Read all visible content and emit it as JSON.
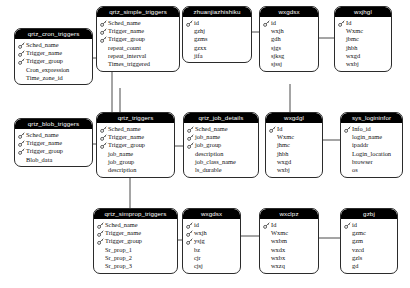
{
  "diagram": {
    "type": "entity-relationship",
    "key_icon": "key-icon",
    "colors": {
      "header_bg": "#000000",
      "header_text": "#ffffff",
      "body_bg": "#ffffff",
      "border": "#2b2b2b",
      "field_text": "#111111",
      "connector": "#4a4a4a"
    }
  },
  "entities": [
    {
      "id": "qrtz_cron_triggers",
      "name": "qrtz_cron_triggers",
      "x": 14,
      "y": 28,
      "w": 79,
      "fields": [
        {
          "name": "Sched_name",
          "key": true
        },
        {
          "name": "Trigger_name",
          "key": true
        },
        {
          "name": "Trigger_group",
          "key": true
        },
        {
          "name": "Cron_expression",
          "key": false
        },
        {
          "name": "Time_zone_id",
          "key": false
        }
      ]
    },
    {
      "id": "qrtz_simple_triggers",
      "name": "qrtz_simple_triggers",
      "x": 96,
      "y": 6,
      "w": 84,
      "fields": [
        {
          "name": "Sched_name",
          "key": true
        },
        {
          "name": "Trigger_name",
          "key": true
        },
        {
          "name": "Trigger_group",
          "key": true
        },
        {
          "name": "repeat_count",
          "key": false
        },
        {
          "name": "repeat_interval",
          "key": false
        },
        {
          "name": "Times_triggered",
          "key": false
        }
      ]
    },
    {
      "id": "zhuanjiazhishiku",
      "name": "zhuanjiazhishiku",
      "x": 182,
      "y": 6,
      "w": 70,
      "fields": [
        {
          "name": "id",
          "key": true
        },
        {
          "name": "gzhj",
          "key": false
        },
        {
          "name": "gzms",
          "key": false
        },
        {
          "name": "gzxx",
          "key": false
        },
        {
          "name": "jifa",
          "key": false
        }
      ]
    },
    {
      "id": "wxgdsx_top",
      "name": "wxgdsx",
      "x": 259,
      "y": 6,
      "w": 60,
      "fields": [
        {
          "name": "id",
          "key": true
        },
        {
          "name": "wxjh",
          "key": false
        },
        {
          "name": "gdh",
          "key": false
        },
        {
          "name": "sjgs",
          "key": false
        },
        {
          "name": "sjksg",
          "key": false
        },
        {
          "name": "sjssj",
          "key": false
        }
      ]
    },
    {
      "id": "wxjhgl",
      "name": "wxjhgl",
      "x": 334,
      "y": 6,
      "w": 58,
      "fields": [
        {
          "name": "Id",
          "key": true
        },
        {
          "name": "Wxmc",
          "key": false
        },
        {
          "name": "jbmc",
          "key": false
        },
        {
          "name": "jhbh",
          "key": false
        },
        {
          "name": "wxgd",
          "key": false
        },
        {
          "name": "wxbj",
          "key": false
        }
      ]
    },
    {
      "id": "qrtz_blob_triggers",
      "name": "qrtz_blob_triggers",
      "x": 14,
      "y": 118,
      "w": 79,
      "fields": [
        {
          "name": "Sched_name",
          "key": true
        },
        {
          "name": "Trigger_name",
          "key": true
        },
        {
          "name": "Trigger_group",
          "key": true
        },
        {
          "name": "Blob_data",
          "key": false
        }
      ]
    },
    {
      "id": "qrtz_triggers",
      "name": "qrtz_triggers",
      "x": 96,
      "y": 112,
      "w": 79,
      "fields": [
        {
          "name": "Sched_name",
          "key": true
        },
        {
          "name": "Trigger_name",
          "key": true
        },
        {
          "name": "Trigger_group",
          "key": true
        },
        {
          "name": "job_name",
          "key": false
        },
        {
          "name": "job_group",
          "key": false
        },
        {
          "name": "description",
          "key": false
        }
      ]
    },
    {
      "id": "qrtz_job_details",
      "name": "qrtz_job_details",
      "x": 183,
      "y": 112,
      "w": 76,
      "fields": [
        {
          "name": "Sched_name",
          "key": true
        },
        {
          "name": "job_name",
          "key": true
        },
        {
          "name": "job_group",
          "key": true
        },
        {
          "name": "description",
          "key": false
        },
        {
          "name": "job_class_name",
          "key": false
        },
        {
          "name": "ls_durable",
          "key": false
        }
      ]
    },
    {
      "id": "wxgdgl",
      "name": "wxgdgl",
      "x": 265,
      "y": 112,
      "w": 58,
      "fields": [
        {
          "name": "Id",
          "key": true
        },
        {
          "name": "Wxmc",
          "key": false
        },
        {
          "name": "jhmc",
          "key": false
        },
        {
          "name": "jhbh",
          "key": false
        },
        {
          "name": "wxgd",
          "key": false
        },
        {
          "name": "wxbj",
          "key": false
        }
      ]
    },
    {
      "id": "sys_logininfor",
      "name": "sys_logininfor",
      "x": 340,
      "y": 112,
      "w": 63,
      "fields": [
        {
          "name": "Info_id",
          "key": true
        },
        {
          "name": "login_name",
          "key": false
        },
        {
          "name": "ipaddr",
          "key": false
        },
        {
          "name": "Login_location",
          "key": false
        },
        {
          "name": "browser",
          "key": false
        },
        {
          "name": "os",
          "key": false
        }
      ]
    },
    {
      "id": "qrtz_simprop_triggers",
      "name": "qrtz_simprop_triggers",
      "x": 93,
      "y": 208,
      "w": 85,
      "fields": [
        {
          "name": "Sched_name",
          "key": true
        },
        {
          "name": "Trigger_name",
          "key": true
        },
        {
          "name": "Trigger_group",
          "key": true
        },
        {
          "name": "Sr_prop_1",
          "key": false
        },
        {
          "name": "Sr_prop_2",
          "key": false
        },
        {
          "name": "Sr_prop_3",
          "key": false
        }
      ]
    },
    {
      "id": "wxgdsx_bottom",
      "name": "wxgdsx",
      "x": 182,
      "y": 208,
      "w": 59,
      "fields": [
        {
          "name": "id",
          "key": true
        },
        {
          "name": "wxjh",
          "key": true
        },
        {
          "name": "ysjg",
          "key": true
        },
        {
          "name": "bz",
          "key": false
        },
        {
          "name": "cjr",
          "key": false
        },
        {
          "name": "cjsj",
          "key": false
        }
      ]
    },
    {
      "id": "wxclpz",
      "name": "wxclpz",
      "x": 259,
      "y": 208,
      "w": 60,
      "fields": [
        {
          "name": "Id",
          "key": true
        },
        {
          "name": "Wxmc",
          "key": false
        },
        {
          "name": "wxbm",
          "key": false
        },
        {
          "name": "wxdx",
          "key": false
        },
        {
          "name": "wxbx",
          "key": false
        },
        {
          "name": "wxzq",
          "key": false
        }
      ]
    },
    {
      "id": "gzbj",
      "name": "gzbj",
      "x": 340,
      "y": 208,
      "w": 58,
      "fields": [
        {
          "name": "id",
          "key": true
        },
        {
          "name": "gzmc",
          "key": false
        },
        {
          "name": "gzm",
          "key": false
        },
        {
          "name": "vzcd",
          "key": false
        },
        {
          "name": "gzls",
          "key": false
        },
        {
          "name": "gd",
          "key": false
        }
      ]
    }
  ],
  "relationships": [
    {
      "from": "qrtz_cron_triggers",
      "to": "qrtz_triggers",
      "path": "M 93 58 L 112 58 L 112 112"
    },
    {
      "from": "qrtz_simple_triggers",
      "to": "qrtz_triggers",
      "path": "M 120 88 L 120 112"
    },
    {
      "from": "qrtz_blob_triggers",
      "to": "qrtz_triggers",
      "path": "M 93 144 L 96 144"
    },
    {
      "from": "qrtz_triggers",
      "to": "qrtz_job_details",
      "path": "M 175 146 L 183 146"
    },
    {
      "from": "qrtz_triggers",
      "to": "qrtz_simprop_triggers",
      "path": "M 130 178 L 130 208"
    },
    {
      "from": "qrtz_simprop_triggers",
      "to": "wxgdsx_bottom",
      "path": "M 178 240 L 182 240"
    },
    {
      "from": "zhuanjiazhishiku",
      "to": "wxgdsx_top",
      "path": "M 252 32 L 259 32"
    },
    {
      "from": "wxgdsx_top",
      "to": "wxjhgl",
      "path": "M 319 38 L 334 38"
    },
    {
      "from": "wxgdsx_top",
      "to": "wxgdgl",
      "path": "M 290 84 L 290 112"
    },
    {
      "from": "wxgdgl",
      "to": "sys_logininfor",
      "path": "M 323 140 L 340 140"
    },
    {
      "from": "wxclpz",
      "to": "gzbj",
      "path": "M 319 238 L 340 238"
    },
    {
      "from": "wxgdsx_bottom",
      "to": "wxclpz",
      "path": "M 241 236 L 259 236"
    }
  ]
}
